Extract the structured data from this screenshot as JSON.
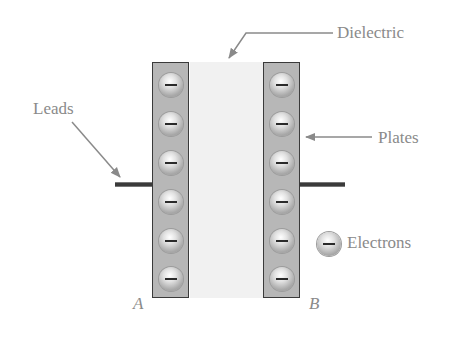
{
  "diagram": {
    "type": "parallel-plate capacitor",
    "labels": {
      "dielectric": "Dielectric",
      "leads": "Leads",
      "plates": "Plates",
      "electrons": "Electrons",
      "plate_a": "A",
      "plate_b": "B"
    },
    "electron_symbol": "−",
    "electrons_per_plate": 6,
    "colors": {
      "plate_fill": "#b7b7b7",
      "plate_border": "#3a3a3a",
      "dielectric_fill": "#f1f1f1",
      "label_text": "#8a8a8a",
      "arrow": "#8a8a8a"
    }
  }
}
